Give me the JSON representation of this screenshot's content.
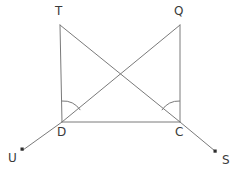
{
  "figure": {
    "type": "geometry-diagram",
    "stroke_color": "#7a7a7a",
    "label_color": "#3a3a3a",
    "background_color": "#ffffff",
    "canvas": {
      "width": 238,
      "height": 172
    }
  },
  "points": [
    {
      "id": "T",
      "label": "T",
      "x": 60,
      "y": 25,
      "label_x": 55,
      "label_y": 5,
      "has_dot": false
    },
    {
      "id": "Q",
      "label": "Q",
      "x": 180,
      "y": 25,
      "label_x": 174,
      "label_y": 5,
      "has_dot": false
    },
    {
      "id": "D",
      "label": "D",
      "x": 62,
      "y": 122,
      "label_x": 57,
      "label_y": 126,
      "has_dot": false
    },
    {
      "id": "C",
      "label": "C",
      "x": 180,
      "y": 122,
      "label_x": 175,
      "label_y": 126,
      "has_dot": false
    },
    {
      "id": "U",
      "label": "U",
      "x": 22,
      "y": 150,
      "label_x": 8,
      "label_y": 152,
      "has_dot": true
    },
    {
      "id": "S",
      "label": "S",
      "x": 216,
      "y": 152,
      "label_x": 222,
      "label_y": 154,
      "has_dot": true
    }
  ],
  "segments": [
    {
      "name": "segment-TD",
      "from": "T",
      "to": "D"
    },
    {
      "name": "segment-QC",
      "from": "Q",
      "to": "C"
    },
    {
      "name": "segment-DC",
      "from": "D",
      "to": "C"
    },
    {
      "name": "segment-TC",
      "from": "T",
      "to": "C"
    },
    {
      "name": "segment-QD",
      "from": "Q",
      "to": "D"
    },
    {
      "name": "ray-DU",
      "from": "D",
      "to": "U"
    },
    {
      "name": "ray-CS",
      "from": "C",
      "to": "S"
    }
  ],
  "angle_marks": [
    {
      "name": "angle-arc-D",
      "vertex": "D",
      "radius": 21,
      "from_ray": "D-T",
      "to_ray": "D-Q"
    },
    {
      "name": "angle-arc-C",
      "vertex": "C",
      "radius": 21,
      "from_ray": "C-T",
      "to_ray": "C-Q"
    }
  ]
}
